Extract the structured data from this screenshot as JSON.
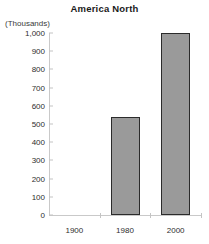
{
  "chart_data": {
    "type": "bar",
    "title": "America North",
    "units_label": "(Thousands)",
    "xlabel": "",
    "ylabel": "",
    "categories": [
      "1900",
      "1980",
      "2000"
    ],
    "values": [
      0,
      540,
      1000
    ],
    "ylim": [
      0,
      1000
    ],
    "yticks": [
      0,
      100,
      200,
      300,
      400,
      500,
      600,
      700,
      800,
      900,
      1000
    ],
    "ytick_labels": [
      "0",
      "100",
      "200",
      "300",
      "400",
      "500",
      "600",
      "700",
      "800",
      "900",
      "1,000"
    ],
    "grid": false,
    "legend": null,
    "series": [
      {
        "name": "Population",
        "values": [
          0,
          540,
          1000
        ]
      }
    ],
    "colors": {
      "bar_fill": "#9a9a9a",
      "bar_border": "#2b2b2b",
      "axis": "#c9c9c9",
      "text": "#2e2e2e",
      "background": "#ffffff"
    }
  }
}
